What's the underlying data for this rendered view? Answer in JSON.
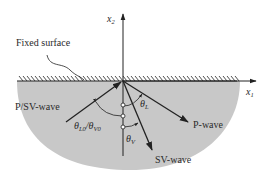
{
  "diagram": {
    "type": "wave reflection at fixed surface",
    "labels": {
      "fixed_surface": "Fixed surface",
      "incident_wave": "P/SV-wave",
      "reflected_p": "P-wave",
      "reflected_sv": "SV-wave",
      "axis_x1_base": "x",
      "axis_x1_sub": "1",
      "axis_x2_base": "x",
      "axis_x2_sub": "2",
      "angle_incident_base1": "θ",
      "angle_incident_sub1": "L0",
      "angle_incident_slash": "/",
      "angle_incident_base2": "θ",
      "angle_incident_sub2": "V0",
      "angle_p_base": "θ",
      "angle_p_sub": "L",
      "angle_sv_base": "θ",
      "angle_sv_sub": "V"
    },
    "colors": {
      "medium_fill": "#c8c8c8",
      "line": "#222222",
      "background": "#ffffff"
    }
  }
}
